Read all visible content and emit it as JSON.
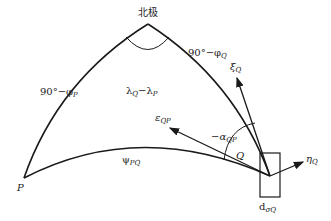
{
  "diagram": {
    "type": "spherical-triangle",
    "vertices": {
      "pole": {
        "label": "北极"
      },
      "P": {
        "label": "P"
      },
      "Q": {
        "label": "Q"
      }
    },
    "sides": {
      "pole_P": {
        "label": "90°−φ",
        "sub": "P"
      },
      "pole_Q": {
        "label": "90°−φ",
        "sub": "Q"
      },
      "P_Q": {
        "label": "ψ",
        "sub": "PQ"
      }
    },
    "angles": {
      "pole": {
        "label": "λ",
        "sub1": "Q",
        "mid": "−λ",
        "sub2": "P"
      },
      "Q": {
        "label": "−α",
        "sub": "QP"
      }
    },
    "vectors": {
      "xi": {
        "label": "ξ",
        "sub": "Q"
      },
      "eta": {
        "label": "η",
        "sub": "Q"
      },
      "eps": {
        "label": "ε",
        "sub": "QP"
      }
    },
    "box": {
      "label": "d",
      "sub": "σQ"
    },
    "colors": {
      "stroke": "#1a1a1a",
      "background": "#ffffff"
    }
  }
}
